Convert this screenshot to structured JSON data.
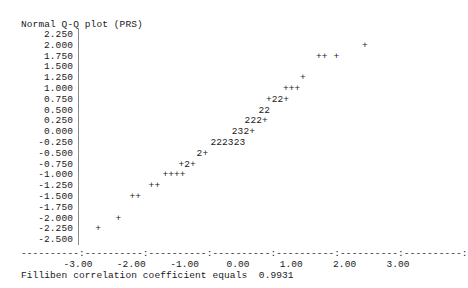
{
  "title": "Normal Q-Q plot (PRS)",
  "footer": "Filliben correlation coefficient equals  0.9931",
  "axis_line_glyphs": "----------:----------:----------:----------:----------:----------:----------:",
  "chart_data": {
    "type": "scatter",
    "title": "Normal Q-Q plot (PRS)",
    "xlabel": "",
    "ylabel": "",
    "xlim": [
      -3.0,
      3.0
    ],
    "ylim": [
      -2.5,
      2.25
    ],
    "grid": false,
    "legend": null,
    "annotation": "Filliben correlation coefficient equals  0.9931",
    "filliben_correlation_coefficient": 0.9931,
    "render_style": "character-cell-ascii",
    "marker_legend": {
      "+": "1 point",
      "2": "2 overlapping points",
      "3": "3 overlapping points"
    },
    "yticks": [
      "2.250",
      "2.000",
      "1.750",
      "1.500",
      "1.250",
      "1.000",
      "0.750",
      "0.500",
      "0.250",
      "0.000",
      "-0.250",
      "-0.500",
      "-0.750",
      "-1.000",
      "-1.250",
      "-1.500",
      "-1.750",
      "-2.000",
      "-2.250",
      "-2.500"
    ],
    "ytick_values": [
      2.25,
      2.0,
      1.75,
      1.5,
      1.25,
      1.0,
      0.75,
      0.5,
      0.25,
      0.0,
      -0.25,
      -0.5,
      -0.75,
      -1.0,
      -1.25,
      -1.5,
      -1.75,
      -2.0,
      -2.25,
      -2.5
    ],
    "xticks": [
      "-3.00",
      "-2.00",
      "-1.00",
      "0.00",
      "1.00",
      "2.00",
      "3.00"
    ],
    "xtick_values": [
      -3.0,
      -2.0,
      -1.0,
      0.0,
      1.0,
      2.0,
      3.0
    ],
    "rows": [
      {
        "y": 2.0,
        "glyphs": "+",
        "x_start": 2.38,
        "points": [
          {
            "x": 2.38,
            "n": 1
          }
        ]
      },
      {
        "y": 1.75,
        "glyphs": "++ +",
        "x_start": 1.52,
        "points": [
          {
            "x": 1.52,
            "n": 1
          },
          {
            "x": 1.63,
            "n": 1
          },
          {
            "x": 1.85,
            "n": 1
          }
        ]
      },
      {
        "y": 1.25,
        "glyphs": "+",
        "x_start": 1.22,
        "points": [
          {
            "x": 1.22,
            "n": 1
          }
        ]
      },
      {
        "y": 1.0,
        "glyphs": "+++",
        "x_start": 0.9,
        "points": [
          {
            "x": 0.9,
            "n": 1
          },
          {
            "x": 1.01,
            "n": 1
          },
          {
            "x": 1.12,
            "n": 1
          }
        ]
      },
      {
        "y": 0.75,
        "glyphs": "+22+",
        "x_start": 0.58,
        "points": [
          {
            "x": 0.58,
            "n": 1
          },
          {
            "x": 0.69,
            "n": 2
          },
          {
            "x": 0.8,
            "n": 2
          },
          {
            "x": 0.91,
            "n": 1
          }
        ]
      },
      {
        "y": 0.5,
        "glyphs": "22",
        "x_start": 0.44,
        "points": [
          {
            "x": 0.44,
            "n": 2
          },
          {
            "x": 0.55,
            "n": 2
          }
        ]
      },
      {
        "y": 0.25,
        "glyphs": "222+",
        "x_start": 0.18,
        "points": [
          {
            "x": 0.18,
            "n": 2
          },
          {
            "x": 0.29,
            "n": 2
          },
          {
            "x": 0.4,
            "n": 2
          },
          {
            "x": 0.51,
            "n": 1
          }
        ]
      },
      {
        "y": 0.0,
        "glyphs": "232+",
        "x_start": -0.06,
        "points": [
          {
            "x": -0.06,
            "n": 2
          },
          {
            "x": 0.05,
            "n": 3
          },
          {
            "x": 0.16,
            "n": 2
          },
          {
            "x": 0.27,
            "n": 1
          }
        ]
      },
      {
        "y": -0.25,
        "glyphs": "222323",
        "x_start": -0.46,
        "points": [
          {
            "x": -0.46,
            "n": 2
          },
          {
            "x": -0.35,
            "n": 2
          },
          {
            "x": -0.24,
            "n": 2
          },
          {
            "x": -0.13,
            "n": 3
          },
          {
            "x": -0.02,
            "n": 2
          },
          {
            "x": 0.09,
            "n": 3
          }
        ]
      },
      {
        "y": -0.5,
        "glyphs": "2+",
        "x_start": -0.72,
        "points": [
          {
            "x": -0.72,
            "n": 2
          },
          {
            "x": -0.61,
            "n": 1
          }
        ]
      },
      {
        "y": -0.75,
        "glyphs": "+2+",
        "x_start": -1.06,
        "points": [
          {
            "x": -1.06,
            "n": 1
          },
          {
            "x": -0.95,
            "n": 2
          },
          {
            "x": -0.84,
            "n": 1
          }
        ]
      },
      {
        "y": -1.0,
        "glyphs": "++++",
        "x_start": -1.36,
        "points": [
          {
            "x": -1.36,
            "n": 1
          },
          {
            "x": -1.25,
            "n": 1
          },
          {
            "x": -1.14,
            "n": 1
          },
          {
            "x": -1.03,
            "n": 1
          }
        ]
      },
      {
        "y": -1.25,
        "glyphs": "++",
        "x_start": -1.62,
        "points": [
          {
            "x": -1.62,
            "n": 1
          },
          {
            "x": -1.51,
            "n": 1
          }
        ]
      },
      {
        "y": -1.5,
        "glyphs": "++",
        "x_start": -1.98,
        "points": [
          {
            "x": -1.98,
            "n": 1
          },
          {
            "x": -1.87,
            "n": 1
          }
        ]
      },
      {
        "y": -2.0,
        "glyphs": "+",
        "x_start": -2.24,
        "points": [
          {
            "x": -2.24,
            "n": 1
          }
        ]
      },
      {
        "y": -2.25,
        "glyphs": "+",
        "x_start": -2.62,
        "points": [
          {
            "x": -2.62,
            "n": 1
          }
        ]
      }
    ]
  }
}
